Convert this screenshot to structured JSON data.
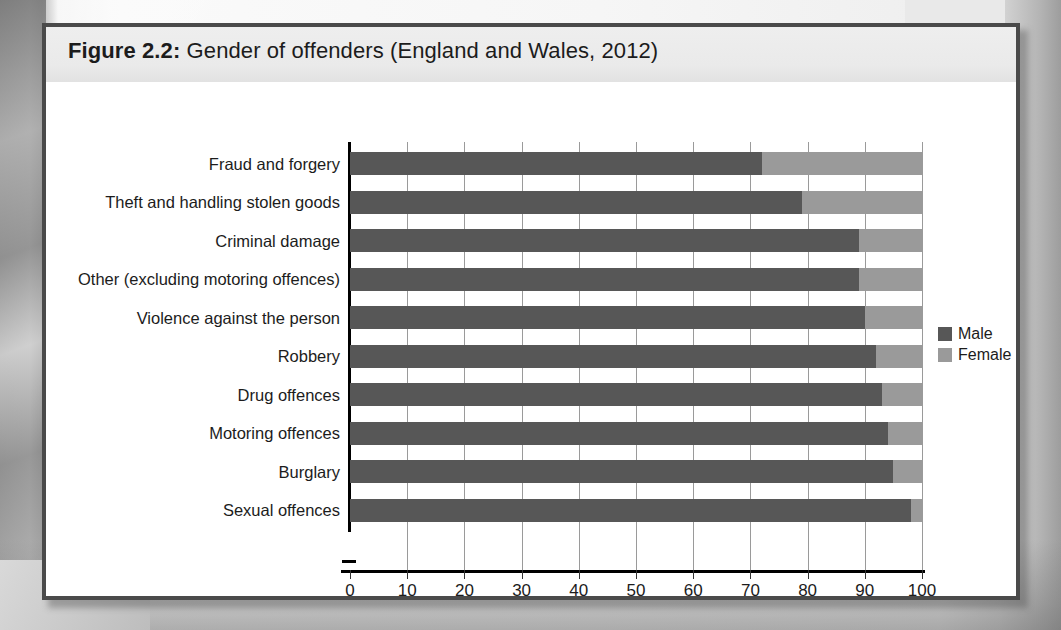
{
  "figure": {
    "number": "Figure 2.2:",
    "title": "Gender of offenders (England and Wales, 2012)",
    "full_title": "Figure 2.2: Gender of offenders (England and Wales, 2012)"
  },
  "legend": {
    "position": "right",
    "entries": [
      {
        "label": "Male",
        "color": "#575757"
      },
      {
        "label": "Female",
        "color": "#9a9a9a"
      }
    ]
  },
  "chart_data": {
    "type": "bar",
    "orientation": "horizontal",
    "stacked": true,
    "stack_total": 100,
    "title": "Figure 2.2: Gender of offenders (England and Wales, 2012)",
    "xlabel": "Percentage of offenders",
    "ylabel": "",
    "xlim": [
      0,
      100
    ],
    "xticks": [
      0,
      10,
      20,
      30,
      40,
      50,
      60,
      70,
      80,
      90,
      100
    ],
    "xtick_labels": [
      "0",
      "10",
      "20",
      "30",
      "40",
      "50",
      "60",
      "70",
      "80",
      "90",
      "100"
    ],
    "grid": "vertical",
    "categories": [
      "Fraud and forgery",
      "Theft and handling stolen goods",
      "Criminal damage",
      "Other (excluding motoring offences)",
      "Violence against the person",
      "Robbery",
      "Drug offences",
      "Motoring offences",
      "Burglary",
      "Sexual offences"
    ],
    "series": [
      {
        "name": "Male",
        "color": "#575757",
        "values": [
          72,
          79,
          89,
          89,
          90,
          92,
          93,
          94,
          95,
          98
        ]
      },
      {
        "name": "Female",
        "color": "#9a9a9a",
        "values": [
          28,
          21,
          11,
          11,
          10,
          8,
          7,
          6,
          5,
          2
        ]
      }
    ]
  }
}
